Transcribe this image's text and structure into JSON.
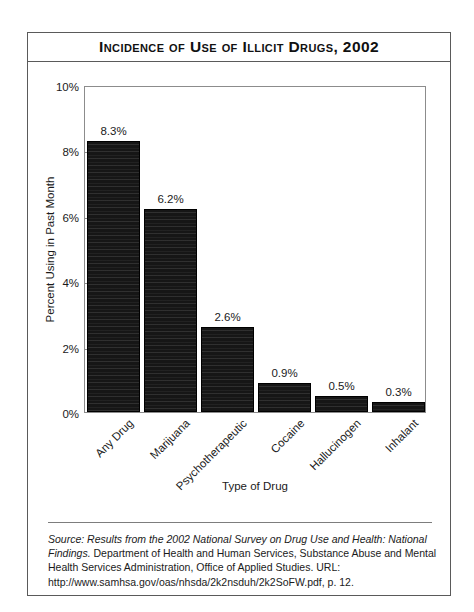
{
  "chart_data": {
    "type": "bar",
    "title": "Incidence of Use of Illicit Drugs, 2002",
    "categories": [
      "Any Drug",
      "Marijuana",
      "Psychotherapeutic",
      "Cocaine",
      "Hallucinogen",
      "Inhalant"
    ],
    "values": [
      8.3,
      6.2,
      2.6,
      0.9,
      0.5,
      0.3
    ],
    "value_labels": [
      "8.3%",
      "6.2%",
      "2.6%",
      "0.9%",
      "0.5%",
      "0.3%"
    ],
    "xlabel": "Type of Drug",
    "ylabel": "Percent Using in Past Month",
    "ylim": [
      0,
      10
    ],
    "ytick_values": [
      0,
      2,
      4,
      6,
      8,
      10
    ],
    "ytick_labels": [
      "0%",
      "2%",
      "4%",
      "6%",
      "8%",
      "10%"
    ],
    "grid": false,
    "legend": null,
    "bar_color": "#161616"
  },
  "source": {
    "italic_part": "Source: Results from the 2002 National Survey on Drug Use and Health: National Findings.",
    "rest_part": " Department of Health and Human Services, Substance Abuse and Mental Health Services Administration, Office of Applied Studies. URL: http://www.samhsa.gov/oas/nhsda/2k2nsduh/2k2SoFW.pdf, p. 12."
  }
}
